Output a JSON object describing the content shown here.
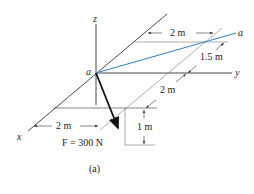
{
  "figure": {
    "caption": "(a)",
    "axes": {
      "x_label": "x",
      "y_label": "y",
      "z_label": "z"
    },
    "points": {
      "origin_label": "a",
      "end_label": "a"
    },
    "force": {
      "label": "F = 300 N",
      "magnitude": "300 N"
    },
    "dimensions": {
      "top_horizontal": "2 m",
      "offset_y": "1.5 m",
      "diagonal": "2 m",
      "bottom_horizontal": "2 m",
      "vertical_drop": "1 m"
    },
    "colors": {
      "line": "#222222",
      "thin_line": "#555555",
      "member_aa": "#3a86b8",
      "force_arrow": "#111111"
    }
  }
}
